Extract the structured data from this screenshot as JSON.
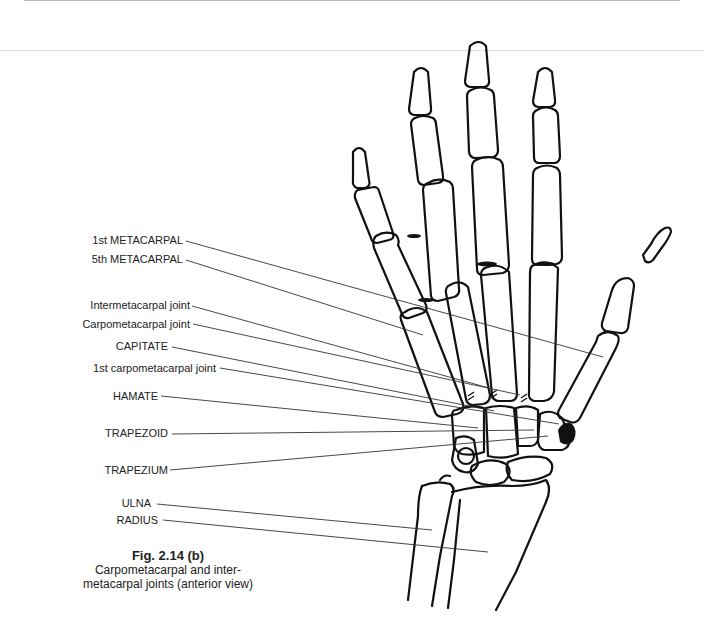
{
  "figure": {
    "number": "Fig. 2.14 (b)",
    "caption_line1": "Carpometacarpal and inter-",
    "caption_line2": "metacarpal joints (anterior view)"
  },
  "labels": [
    {
      "id": "first-metacarpal",
      "text": "1st METACARPAL"
    },
    {
      "id": "fifth-metacarpal",
      "text": "5th METACARPAL"
    },
    {
      "id": "intermetacarpal-joint",
      "text": "Intermetacarpal joint"
    },
    {
      "id": "carpometacarpal-joint",
      "text": "Carpometacarpal joint"
    },
    {
      "id": "capitate",
      "text": "CAPITATE"
    },
    {
      "id": "first-carpometacarpal-joint",
      "text": "1st carpometacarpal joint"
    },
    {
      "id": "hamate",
      "text": "HAMATE"
    },
    {
      "id": "trapezoid",
      "text": "TRAPEZOID"
    },
    {
      "id": "trapezium",
      "text": "TRAPEZIUM"
    },
    {
      "id": "ulna",
      "text": "ULNA"
    },
    {
      "id": "radius",
      "text": "RADIUS"
    }
  ]
}
